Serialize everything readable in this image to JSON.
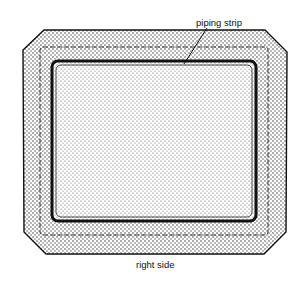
{
  "diagram": {
    "title": "",
    "labels": {
      "piping_strip": "piping strip",
      "right_side": "right side"
    },
    "colors": {
      "ink": "#111111",
      "background": "#ffffff"
    }
  }
}
